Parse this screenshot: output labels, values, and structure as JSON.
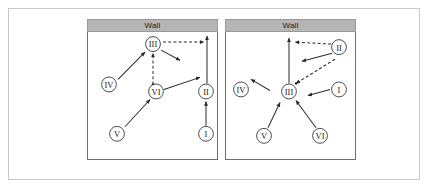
{
  "figure": {
    "panels": [
      {
        "id": "panel-left",
        "wall_label": "Wall",
        "nodes": [
          {
            "id": "III",
            "label": "III",
            "x": 65,
            "y": 12
          },
          {
            "id": "IV",
            "label": "IV",
            "x": 21,
            "y": 52
          },
          {
            "id": "VI",
            "label": "VI",
            "x": 68,
            "y": 59
          },
          {
            "id": "II",
            "label": "II",
            "x": 118,
            "y": 59
          },
          {
            "id": "V",
            "label": "V",
            "x": 29,
            "y": 101
          },
          {
            "id": "I",
            "label": "I",
            "x": 118,
            "y": 101
          }
        ],
        "edges": [
          {
            "from": "IV",
            "to": "III",
            "style": "solid"
          },
          {
            "from": "VI",
            "to": "III",
            "style": "dashed"
          },
          {
            "from": "V",
            "to": "VI",
            "style": "solid"
          },
          {
            "from": "VI",
            "to": "II",
            "style": "solid"
          },
          {
            "from": "I",
            "to": "II",
            "style": "solid"
          },
          {
            "from": "III",
            "to": "wall",
            "style": "dashed"
          },
          {
            "from": "II",
            "to": "wall",
            "style": "solid"
          },
          {
            "from": "III",
            "to": "free",
            "style": "solid"
          }
        ]
      },
      {
        "id": "panel-right",
        "wall_label": "Wall",
        "nodes": [
          {
            "id": "II",
            "label": "II",
            "x": 113,
            "y": 15
          },
          {
            "id": "IV",
            "label": "IV",
            "x": 15,
            "y": 57
          },
          {
            "id": "III",
            "label": "III",
            "x": 63,
            "y": 59
          },
          {
            "id": "I",
            "label": "I",
            "x": 113,
            "y": 57
          },
          {
            "id": "V",
            "label": "V",
            "x": 38,
            "y": 103
          },
          {
            "id": "VI",
            "label": "VI",
            "x": 94,
            "y": 103
          }
        ],
        "edges": [
          {
            "from": "II",
            "to": "wall",
            "style": "dashed"
          },
          {
            "from": "III",
            "to": "wall",
            "style": "solid"
          },
          {
            "from": "II",
            "to": "III",
            "style": "solid"
          },
          {
            "from": "II",
            "to": "III",
            "style": "dashed"
          },
          {
            "from": "III",
            "to": "IV",
            "style": "solid"
          },
          {
            "from": "I",
            "to": "III",
            "style": "solid"
          },
          {
            "from": "V",
            "to": "III",
            "style": "solid"
          },
          {
            "from": "VI",
            "to": "III",
            "style": "solid"
          }
        ]
      }
    ]
  },
  "colors": {
    "wall_fill": "#b5b5b5",
    "stage_border": "#6e6e6e",
    "frame_border": "#c9c9c9",
    "stroke": "#2b2b2b"
  }
}
